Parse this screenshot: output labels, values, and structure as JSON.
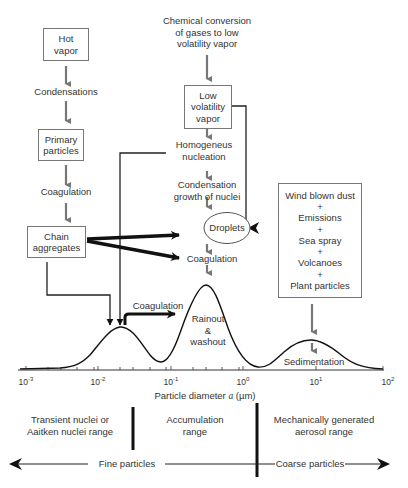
{
  "diagram": {
    "left_chain": {
      "hot_vapor": [
        "Hot",
        "vapor"
      ],
      "condensations": "Condensations",
      "primary_particles": [
        "Primary",
        "particles"
      ],
      "coagulation": "Coagulation",
      "chain_aggregates": [
        "Chain",
        "aggregates"
      ]
    },
    "middle_chain": {
      "chemical_conversion": [
        "Chemical conversion",
        "of gases to low",
        "volatility vapor"
      ],
      "low_volatility_vapor": [
        "Low",
        "volatility",
        "vapor"
      ],
      "homogeneus_nucleation": [
        "Homogeneus",
        "nucleation"
      ],
      "condensation_growth": [
        "Condensation",
        "growth of nuclei"
      ],
      "droplets": "Droplets",
      "coagulation": "Coagulation"
    },
    "right_box": {
      "lines": [
        "Wind blown dust",
        "+",
        "Emissions",
        "+",
        "Sea spray",
        "+",
        "Volcanoes",
        "+",
        "Plant particles"
      ]
    },
    "curve_labels": {
      "coagulation": "Coagulation",
      "rainout": [
        "Rainout",
        "&",
        "washout"
      ],
      "sedimentation": "Sedimentation"
    },
    "axis": {
      "ticks": [
        {
          "base": "10",
          "exp": "-3"
        },
        {
          "base": "10",
          "exp": "-2"
        },
        {
          "base": "10",
          "exp": "-1"
        },
        {
          "base": "10",
          "exp": "0"
        },
        {
          "base": "10",
          "exp": "1"
        },
        {
          "base": "10",
          "exp": "2"
        }
      ],
      "label_prefix": "Particle diameter ",
      "label_var": "a",
      "label_suffix": " (µm)"
    },
    "ranges": {
      "transient": [
        "Transient nuclei or",
        "Aaitken nuclei range"
      ],
      "accumulation": [
        "Accumulation",
        "range"
      ],
      "mechanical": [
        "Mechanically generated",
        "aerosol range"
      ],
      "fine": "Fine particles",
      "coarse": "Coarse particles"
    }
  }
}
